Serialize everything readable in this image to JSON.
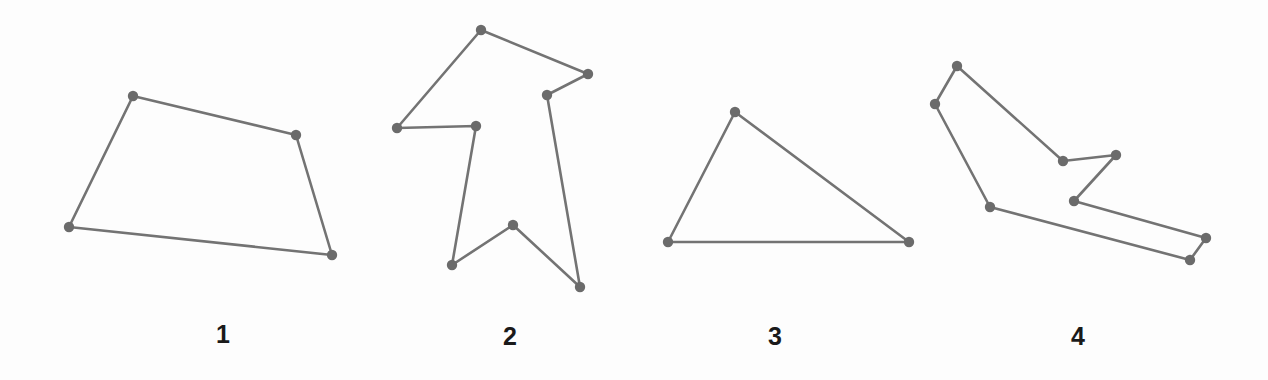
{
  "figure": {
    "background_color": "#fdfdfd",
    "stroke_color": "#737373",
    "vertex_color": "#6b6b6b",
    "label_color": "#1a1a1a",
    "stroke_width": 2.6,
    "vertex_radius": 5.2,
    "width": 1268,
    "height": 380
  },
  "shapes": [
    {
      "label": "1",
      "name": "polygon-quadrilateral",
      "label_x": 223,
      "label_y": 334,
      "vertex_count": 4,
      "points": "133,96 296,135 332,255 69,227"
    },
    {
      "label": "2",
      "name": "polygon-arrow-banner",
      "label_x": 510,
      "label_y": 336,
      "vertex_count": 8,
      "points": "481,30 588,74 547,95 580,287 513,225 452,265 476,126 397,128"
    },
    {
      "label": "3",
      "name": "polygon-triangle",
      "label_x": 775,
      "label_y": 336,
      "vertex_count": 3,
      "points": "735,112 909,242 668,242"
    },
    {
      "label": "4",
      "name": "polygon-zigzag-band",
      "label_x": 1078,
      "label_y": 336,
      "vertex_count": 8,
      "points": "957,66 1063,161 1116,155 1074,201 1206,238 1190,260 990,207 935,104"
    }
  ]
}
